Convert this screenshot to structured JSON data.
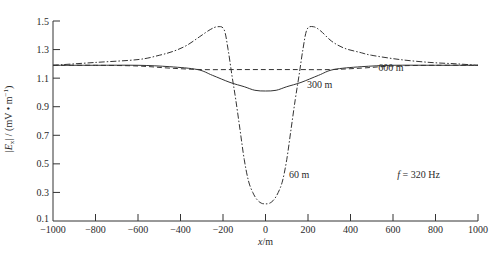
{
  "chart_data": {
    "type": "line",
    "title": "",
    "xlabel": "x/m",
    "ylabel": "|E_x| / (mV • m^-1)",
    "xlim": [
      -1000,
      1000
    ],
    "ylim": [
      0.1,
      1.5
    ],
    "xticks": [
      -1000,
      -800,
      -600,
      -400,
      -200,
      0,
      200,
      400,
      600,
      800,
      1000
    ],
    "xtick_labels": [
      "-1000",
      "-800",
      "-600",
      "-400",
      "-200",
      "0",
      "200",
      "400",
      "600",
      "800",
      "1000"
    ],
    "yticks": [
      0.1,
      0.3,
      0.5,
      0.7,
      0.9,
      1.1,
      1.3,
      1.5
    ],
    "ytick_labels": [
      "0.1",
      "0.3",
      "0.5",
      "0.7",
      "0.9",
      "1.1",
      "1.3",
      "1.5"
    ],
    "grid": false,
    "legend": "none (inline curve labels)",
    "series": [
      {
        "name": "60 m",
        "style": "dash-dot",
        "x": [
          -1000,
          -800,
          -600,
          -500,
          -430,
          -370,
          -310,
          -260,
          -225,
          -195,
          -176,
          -158,
          -140,
          -120,
          -100,
          -80,
          -60,
          -40,
          -20,
          0,
          20,
          40,
          60,
          80,
          100,
          120,
          140,
          158,
          176,
          195,
          225,
          260,
          310,
          370,
          445,
          500,
          633,
          774,
          900,
          1000
        ],
        "y": [
          1.19,
          1.21,
          1.23,
          1.26,
          1.29,
          1.33,
          1.39,
          1.44,
          1.46,
          1.44,
          1.3,
          1.12,
          0.95,
          0.74,
          0.53,
          0.38,
          0.3,
          0.25,
          0.225,
          0.22,
          0.225,
          0.25,
          0.3,
          0.38,
          0.53,
          0.74,
          0.95,
          1.12,
          1.3,
          1.44,
          1.46,
          1.43,
          1.36,
          1.31,
          1.28,
          1.26,
          1.23,
          1.21,
          1.2,
          1.19
        ]
      },
      {
        "name": "300 m",
        "style": "solid",
        "x": [
          -1000,
          -800,
          -600,
          -450,
          -320,
          -250,
          -167,
          -100,
          -50,
          0,
          50,
          100,
          167,
          250,
          320,
          450,
          600,
          800,
          1000
        ],
        "y": [
          1.19,
          1.19,
          1.19,
          1.18,
          1.16,
          1.12,
          1.07,
          1.04,
          1.015,
          1.01,
          1.015,
          1.04,
          1.07,
          1.12,
          1.16,
          1.18,
          1.19,
          1.19,
          1.19
        ]
      },
      {
        "name": "600 m",
        "style": "dashed",
        "x": [
          -1000,
          -800,
          -600,
          -450,
          -300,
          -150,
          0,
          150,
          300,
          450,
          600,
          800,
          1000
        ],
        "y": [
          1.19,
          1.19,
          1.185,
          1.17,
          1.16,
          1.16,
          1.16,
          1.16,
          1.16,
          1.17,
          1.185,
          1.19,
          1.19
        ]
      }
    ],
    "annotations": [
      {
        "text": "60 m",
        "x": 110,
        "y": 0.4
      },
      {
        "text": "300 m",
        "x": 195,
        "y": 1.03
      },
      {
        "text": "600 m",
        "x": 530,
        "y": 1.15
      },
      {
        "text": "f = 320 Hz",
        "x": 620,
        "y": 0.4
      }
    ]
  }
}
